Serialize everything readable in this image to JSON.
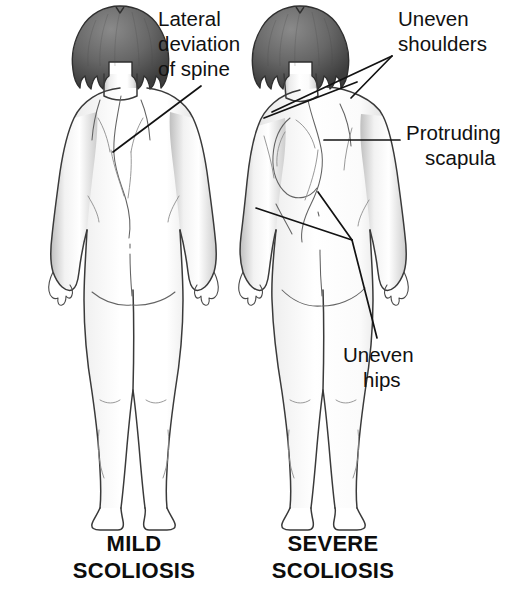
{
  "figure": {
    "background_color": "#ffffff",
    "text_color": "#111111",
    "line_color": "#121212",
    "hair_color": "#5f5f5f",
    "skin_shade_color": "#d8d8d8"
  },
  "annotations": {
    "lateral_deviation": {
      "line1": "Lateral",
      "line2": "deviation",
      "line3": "of spine"
    },
    "uneven_shoulders": {
      "line1": "Uneven",
      "line2": "shoulders"
    },
    "protruding_scapula": {
      "line1": "Protruding",
      "line2": "scapula"
    },
    "uneven_hips": {
      "line1": "Uneven",
      "line2": "hips"
    }
  },
  "captions": {
    "left": {
      "line1": "MILD",
      "line2": "SCOLIOSIS"
    },
    "right": {
      "line1": "SEVERE",
      "line2": "SCOLIOSIS"
    }
  }
}
